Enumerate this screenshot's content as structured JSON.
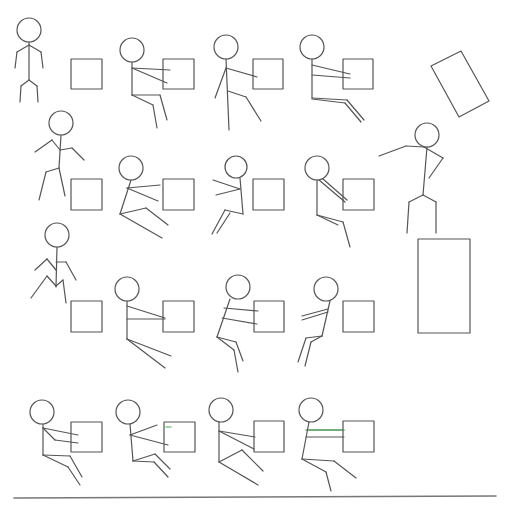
{
  "diagram": {
    "stroke_color": "#555555",
    "accent_color": "#3cb44b",
    "baseline": {
      "x1": 14,
      "y1": 498,
      "x2": 496,
      "y2": 496
    },
    "figures": [
      {
        "name": "figure-standing",
        "head": [
          29,
          30,
          12
        ],
        "lines": [
          [
            29,
            42,
            29,
            80
          ],
          [
            29,
            80,
            21,
            86
          ],
          [
            21,
            86,
            20,
            102
          ],
          [
            29,
            80,
            37,
            86
          ],
          [
            37,
            86,
            38,
            102
          ],
          [
            29,
            45,
            17,
            52
          ],
          [
            17,
            52,
            15,
            68
          ],
          [
            29,
            45,
            41,
            52
          ],
          [
            41,
            52,
            43,
            68
          ]
        ]
      },
      {
        "name": "figure-r1c2",
        "head": [
          132,
          50,
          12
        ],
        "lines": [
          [
            132,
            62,
            132,
            95
          ],
          [
            132,
            68,
            170,
            70
          ],
          [
            132,
            68,
            167,
            83
          ],
          [
            132,
            95,
            160,
            95
          ],
          [
            160,
            95,
            167,
            120
          ],
          [
            132,
            95,
            153,
            105
          ],
          [
            153,
            105,
            157,
            128
          ]
        ]
      },
      {
        "name": "figure-r1c3",
        "head": [
          226,
          47,
          12
        ],
        "lines": [
          [
            226,
            59,
            229,
            130
          ],
          [
            226,
            68,
            257,
            77
          ],
          [
            226,
            68,
            215,
            98
          ],
          [
            228,
            91,
            246,
            97
          ],
          [
            246,
            97,
            261,
            121
          ]
        ]
      },
      {
        "name": "figure-r1c4",
        "head": [
          312,
          47,
          12
        ],
        "lines": [
          [
            312,
            59,
            312,
            98
          ],
          [
            312,
            65,
            350,
            74
          ],
          [
            312,
            75,
            350,
            78
          ],
          [
            312,
            98,
            347,
            100
          ],
          [
            347,
            100,
            364,
            120
          ],
          [
            312,
            99,
            345,
            103
          ],
          [
            345,
            103,
            361,
            122
          ]
        ]
      },
      {
        "name": "figure-r2c1",
        "head": [
          61,
          123,
          12
        ],
        "lines": [
          [
            61,
            135,
            59,
            168
          ],
          [
            59,
            168,
            46,
            172
          ],
          [
            46,
            172,
            39,
            200
          ],
          [
            59,
            168,
            65,
            196
          ],
          [
            60,
            150,
            52,
            140
          ],
          [
            52,
            140,
            35,
            152
          ],
          [
            60,
            150,
            72,
            148
          ],
          [
            72,
            148,
            84,
            160
          ]
        ]
      },
      {
        "name": "figure-r2c2",
        "head": [
          131,
          168,
          12
        ],
        "lines": [
          [
            131,
            180,
            120,
            214
          ],
          [
            127,
            188,
            160,
            185
          ],
          [
            127,
            188,
            158,
            201
          ],
          [
            120,
            214,
            146,
            208
          ],
          [
            146,
            208,
            168,
            225
          ],
          [
            120,
            214,
            162,
            238
          ]
        ]
      },
      {
        "name": "figure-r2c3",
        "head": [
          236,
          167,
          11
        ],
        "lines": [
          [
            240,
            178,
            243,
            214
          ],
          [
            240,
            189,
            213,
            180
          ],
          [
            240,
            189,
            216,
            195
          ],
          [
            243,
            214,
            225,
            210
          ],
          [
            225,
            210,
            212,
            234
          ],
          [
            230,
            213,
            217,
            233
          ]
        ]
      },
      {
        "name": "figure-r2c4",
        "head": [
          317,
          168,
          12
        ],
        "lines": [
          [
            317,
            180,
            317,
            215
          ],
          [
            323,
            179,
            347,
            200
          ],
          [
            319,
            180,
            345,
            202
          ],
          [
            317,
            215,
            343,
            222
          ],
          [
            343,
            222,
            350,
            247
          ],
          [
            317,
            215,
            338,
            225
          ]
        ]
      },
      {
        "name": "figure-jumping",
        "head": [
          427,
          135,
          12
        ],
        "lines": [
          [
            427,
            147,
            423,
            195
          ],
          [
            424,
            147,
            406,
            146
          ],
          [
            406,
            146,
            379,
            156
          ],
          [
            424,
            147,
            443,
            158
          ],
          [
            443,
            158,
            429,
            178
          ],
          [
            423,
            195,
            409,
            202
          ],
          [
            409,
            202,
            407,
            233
          ],
          [
            423,
            195,
            436,
            202
          ],
          [
            436,
            202,
            436,
            233
          ]
        ]
      },
      {
        "name": "figure-r3c1",
        "head": [
          57,
          235,
          12
        ],
        "lines": [
          [
            57,
            247,
            56,
            287
          ],
          [
            56,
            270,
            47,
            259
          ],
          [
            47,
            259,
            35,
            270
          ],
          [
            56,
            262,
            66,
            262
          ],
          [
            66,
            262,
            76,
            280
          ],
          [
            56,
            286,
            47,
            276
          ],
          [
            47,
            276,
            31,
            298
          ],
          [
            56,
            286,
            63,
            280
          ],
          [
            63,
            280,
            66,
            303
          ]
        ]
      },
      {
        "name": "figure-r3c2",
        "head": [
          127,
          289,
          12
        ],
        "lines": [
          [
            127,
            301,
            127,
            339
          ],
          [
            127,
            306,
            165,
            318
          ],
          [
            127,
            319,
            165,
            319
          ],
          [
            127,
            339,
            171,
            356
          ],
          [
            127,
            339,
            165,
            368
          ]
        ]
      },
      {
        "name": "figure-r3c3",
        "head": [
          238,
          287,
          12
        ],
        "lines": [
          [
            230,
            299,
            217,
            337
          ],
          [
            224,
            308,
            258,
            311
          ],
          [
            222,
            318,
            257,
            324
          ],
          [
            217,
            337,
            236,
            342
          ],
          [
            236,
            342,
            243,
            361
          ],
          [
            217,
            337,
            234,
            350
          ],
          [
            234,
            350,
            238,
            372
          ]
        ]
      },
      {
        "name": "figure-r3c4",
        "head": [
          326,
          289,
          12
        ],
        "lines": [
          [
            330,
            301,
            322,
            336
          ],
          [
            328,
            309,
            302,
            316
          ],
          [
            328,
            312,
            302,
            320
          ],
          [
            322,
            336,
            306,
            338
          ],
          [
            306,
            338,
            298,
            362
          ],
          [
            322,
            336,
            311,
            342
          ],
          [
            311,
            342,
            305,
            366
          ]
        ]
      },
      {
        "name": "figure-r4c1",
        "head": [
          42,
          412,
          12
        ],
        "lines": [
          [
            43,
            424,
            43,
            455
          ],
          [
            43,
            428,
            78,
            435
          ],
          [
            43,
            428,
            55,
            440
          ],
          [
            55,
            440,
            78,
            443
          ],
          [
            43,
            455,
            70,
            456
          ],
          [
            70,
            456,
            82,
            477
          ],
          [
            43,
            455,
            68,
            467
          ],
          [
            68,
            467,
            80,
            485
          ]
        ]
      },
      {
        "name": "figure-r4c2",
        "head": [
          128,
          412,
          12
        ],
        "lines": [
          [
            130,
            424,
            133,
            461
          ],
          [
            130,
            435,
            157,
            425
          ],
          [
            130,
            435,
            168,
            445
          ],
          [
            133,
            461,
            155,
            454
          ],
          [
            155,
            454,
            170,
            469
          ],
          [
            133,
            461,
            154,
            462
          ],
          [
            154,
            462,
            168,
            477
          ]
        ]
      },
      {
        "name": "figure-r4c3",
        "head": [
          221,
          410,
          12
        ],
        "lines": [
          [
            219,
            422,
            219,
            462
          ],
          [
            219,
            431,
            255,
            437
          ],
          [
            219,
            431,
            254,
            449
          ],
          [
            219,
            462,
            242,
            450
          ],
          [
            242,
            450,
            263,
            471
          ],
          [
            219,
            462,
            258,
            485
          ]
        ]
      },
      {
        "name": "figure-r4c4",
        "head": [
          311,
          410,
          12
        ],
        "lines": [
          [
            309,
            422,
            302,
            459
          ],
          [
            306,
            430,
            344,
            430
          ],
          [
            306,
            437,
            344,
            437
          ],
          [
            302,
            459,
            334,
            461
          ],
          [
            334,
            461,
            356,
            478
          ],
          [
            302,
            459,
            326,
            472
          ],
          [
            326,
            472,
            331,
            491
          ]
        ]
      }
    ],
    "green_marks": [
      [
        309,
        430,
        344,
        430
      ],
      [
        166,
        427,
        171,
        427
      ]
    ],
    "boxes": [
      {
        "name": "box-r1c1",
        "x": 71,
        "y": 59,
        "w": 31,
        "h": 30
      },
      {
        "name": "box-r1c2",
        "x": 163,
        "y": 59,
        "w": 31,
        "h": 30
      },
      {
        "name": "box-r1c3",
        "x": 253,
        "y": 59,
        "w": 30,
        "h": 30
      },
      {
        "name": "box-r1c4",
        "x": 343,
        "y": 59,
        "w": 30,
        "h": 30
      },
      {
        "name": "box-r2c1",
        "x": 71,
        "y": 179,
        "w": 31,
        "h": 31
      },
      {
        "name": "box-r2c2",
        "x": 163,
        "y": 179,
        "w": 31,
        "h": 31
      },
      {
        "name": "box-r2c3",
        "x": 253,
        "y": 179,
        "w": 31,
        "h": 31
      },
      {
        "name": "box-r2c4",
        "x": 343,
        "y": 179,
        "w": 31,
        "h": 31
      },
      {
        "name": "box-r3c1",
        "x": 71,
        "y": 301,
        "w": 31,
        "h": 31
      },
      {
        "name": "box-r3c2",
        "x": 163,
        "y": 301,
        "w": 31,
        "h": 31
      },
      {
        "name": "box-r3c3",
        "x": 254,
        "y": 301,
        "w": 30,
        "h": 31
      },
      {
        "name": "box-r3c4",
        "x": 343,
        "y": 301,
        "w": 31,
        "h": 31
      },
      {
        "name": "box-r4c1",
        "x": 71,
        "y": 422,
        "w": 31,
        "h": 30
      },
      {
        "name": "box-r4c2",
        "x": 164,
        "y": 422,
        "w": 31,
        "h": 30
      },
      {
        "name": "box-r4c3",
        "x": 254,
        "y": 421,
        "w": 30,
        "h": 31
      },
      {
        "name": "box-r4c4",
        "x": 343,
        "y": 421,
        "w": 31,
        "h": 31
      },
      {
        "name": "platform-box",
        "x": 418,
        "y": 239,
        "w": 52,
        "h": 94
      }
    ],
    "tilted_box": {
      "name": "tilted-box",
      "points": "431,66 461,51 489,101 459,117"
    }
  }
}
